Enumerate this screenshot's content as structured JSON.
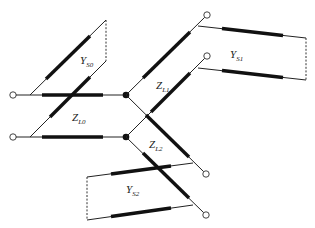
{
  "diagram": {
    "type": "equivalent-circuit",
    "labels": {
      "ys0": {
        "main": "Y",
        "sub": "S0"
      },
      "zl0": {
        "main": "Z",
        "sub": "L0"
      },
      "zl1": {
        "main": "Z",
        "sub": "L1"
      },
      "ys1": {
        "main": "Y",
        "sub": "S1"
      },
      "zl2": {
        "main": "Z",
        "sub": "L2"
      },
      "ys2": {
        "main": "Y",
        "sub": "S2"
      }
    },
    "colors": {
      "line": "#111111",
      "background": "#ffffff"
    }
  }
}
